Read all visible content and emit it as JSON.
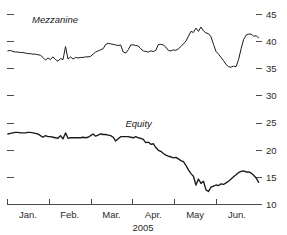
{
  "chart_data": {
    "type": "line",
    "title": "",
    "xlabel": "2005",
    "ylabel": "",
    "ylim": [
      10,
      45
    ],
    "y_ticks": [
      45,
      40,
      35,
      30,
      25,
      20,
      15,
      10
    ],
    "y_tick_labels": [
      "45",
      "40",
      "35",
      "30",
      "25",
      "20",
      "15",
      "10"
    ],
    "y_axis_position": "right",
    "left_axis_ticks_unlabeled": true,
    "grid": false,
    "legend": "inline-annotations",
    "categories": [
      "Jan.",
      "Feb.",
      "Mar.",
      "Apr.",
      "May",
      "Jun."
    ],
    "x_tick_labels": [
      "Jan.",
      "Feb.",
      "Mar.",
      "Apr.",
      "May",
      "Jun."
    ],
    "x_tick_positions": [
      0.5,
      1.5,
      2.5,
      3.5,
      4.5,
      5.5
    ],
    "x_range": [
      0,
      6.1
    ],
    "series": [
      {
        "name": "Mezzanine",
        "color": "#1a1a1a",
        "label_x": 1.15,
        "label_y": 43.3,
        "x": [
          0.02,
          0.08,
          0.14,
          0.2,
          0.26,
          0.32,
          0.38,
          0.44,
          0.5,
          0.56,
          0.62,
          0.68,
          0.74,
          0.8,
          0.86,
          0.92,
          0.98,
          1.04,
          1.1,
          1.16,
          1.22,
          1.28,
          1.34,
          1.4,
          1.46,
          1.52,
          1.58,
          1.64,
          1.7,
          1.76,
          1.82,
          1.88,
          1.94,
          2.0,
          2.06,
          2.12,
          2.18,
          2.24,
          2.3,
          2.36,
          2.42,
          2.48,
          2.54,
          2.6,
          2.66,
          2.72,
          2.78,
          2.84,
          2.9,
          2.96,
          3.02,
          3.08,
          3.14,
          3.2,
          3.26,
          3.32,
          3.38,
          3.44,
          3.5,
          3.56,
          3.62,
          3.68,
          3.74,
          3.8,
          3.86,
          3.92,
          3.98,
          4.04,
          4.1,
          4.16,
          4.22,
          4.28,
          4.34,
          4.4,
          4.46,
          4.52,
          4.58,
          4.64,
          4.7,
          4.76,
          4.82,
          4.88,
          4.94,
          5.0,
          5.06,
          5.12,
          5.18,
          5.24,
          5.3,
          5.36,
          5.42,
          5.48,
          5.54,
          5.6,
          5.66,
          5.72,
          5.78,
          5.84,
          5.9,
          5.96,
          6.02
        ],
        "values": [
          38.2,
          38.3,
          38.1,
          38.0,
          38.0,
          37.9,
          37.9,
          37.8,
          37.7,
          37.7,
          37.6,
          37.6,
          37.5,
          37.4,
          37.0,
          36.5,
          36.9,
          36.6,
          37.1,
          36.6,
          36.3,
          36.8,
          36.6,
          39.0,
          36.7,
          37.1,
          36.7,
          37.0,
          36.9,
          37.0,
          37.0,
          37.1,
          37.1,
          37.2,
          37.6,
          38.0,
          38.2,
          38.4,
          38.6,
          39.4,
          39.6,
          39.5,
          39.4,
          39.3,
          39.2,
          39.3,
          38.0,
          37.8,
          38.4,
          39.3,
          39.3,
          39.2,
          39.1,
          38.6,
          38.2,
          38.1,
          38.0,
          38.2,
          38.1,
          38.3,
          39.4,
          39.4,
          39.3,
          38.9,
          38.3,
          38.2,
          38.4,
          38.3,
          38.6,
          39.0,
          39.5,
          40.0,
          40.9,
          41.8,
          41.6,
          42.4,
          41.8,
          42.6,
          41.9,
          41.5,
          41.4,
          40.8,
          39.4,
          38.1,
          37.6,
          37.0,
          36.4,
          35.7,
          35.3,
          35.2,
          35.4,
          35.3,
          36.6,
          38.6,
          40.3,
          41.1,
          41.3,
          41.3,
          40.9,
          41.0,
          40.6
        ]
      },
      {
        "name": "Equity",
        "color": "#1a1a1a",
        "label_x": 3.15,
        "label_y": 24.1,
        "x": [
          0.02,
          0.08,
          0.14,
          0.2,
          0.26,
          0.32,
          0.38,
          0.44,
          0.5,
          0.56,
          0.62,
          0.68,
          0.74,
          0.8,
          0.86,
          0.92,
          0.98,
          1.04,
          1.1,
          1.16,
          1.22,
          1.28,
          1.34,
          1.4,
          1.46,
          1.52,
          1.58,
          1.64,
          1.7,
          1.76,
          1.82,
          1.88,
          1.94,
          2.0,
          2.06,
          2.12,
          2.18,
          2.24,
          2.3,
          2.36,
          2.42,
          2.48,
          2.54,
          2.6,
          2.66,
          2.72,
          2.78,
          2.84,
          2.9,
          2.96,
          3.02,
          3.08,
          3.14,
          3.2,
          3.26,
          3.32,
          3.38,
          3.44,
          3.5,
          3.56,
          3.62,
          3.68,
          3.74,
          3.8,
          3.86,
          3.92,
          3.98,
          4.04,
          4.1,
          4.16,
          4.22,
          4.28,
          4.34,
          4.4,
          4.46,
          4.52,
          4.58,
          4.64,
          4.7,
          4.76,
          4.82,
          4.88,
          4.94,
          5.0,
          5.06,
          5.12,
          5.18,
          5.24,
          5.3,
          5.36,
          5.42,
          5.48,
          5.54,
          5.6,
          5.66,
          5.72,
          5.78,
          5.84,
          5.9,
          5.96,
          6.02
        ],
        "values": [
          22.9,
          23.0,
          23.1,
          23.2,
          23.2,
          23.1,
          23.1,
          23.1,
          23.2,
          23.2,
          23.1,
          23.0,
          22.9,
          22.6,
          22.3,
          22.6,
          22.4,
          22.4,
          22.3,
          22.2,
          22.1,
          22.6,
          22.0,
          23.1,
          22.1,
          22.2,
          22.2,
          22.2,
          22.2,
          22.2,
          22.3,
          22.2,
          22.3,
          22.6,
          22.9,
          22.5,
          22.7,
          22.9,
          22.8,
          22.8,
          22.7,
          22.6,
          22.3,
          21.6,
          22.0,
          22.4,
          22.4,
          22.4,
          22.4,
          22.3,
          22.2,
          22.4,
          22.2,
          22.1,
          21.9,
          21.3,
          21.4,
          21.0,
          21.1,
          20.4,
          19.9,
          19.7,
          19.3,
          19.0,
          18.8,
          18.7,
          18.5,
          18.6,
          18.3,
          18.0,
          17.8,
          17.1,
          16.3,
          15.6,
          15.1,
          13.5,
          14.6,
          13.8,
          14.2,
          12.6,
          12.3,
          13.1,
          13.3,
          13.5,
          13.4,
          13.7,
          13.6,
          13.9,
          14.2,
          14.6,
          15.0,
          15.4,
          15.8,
          16.0,
          16.1,
          15.9,
          15.9,
          15.7,
          15.3,
          14.8,
          14.0
        ]
      }
    ]
  }
}
